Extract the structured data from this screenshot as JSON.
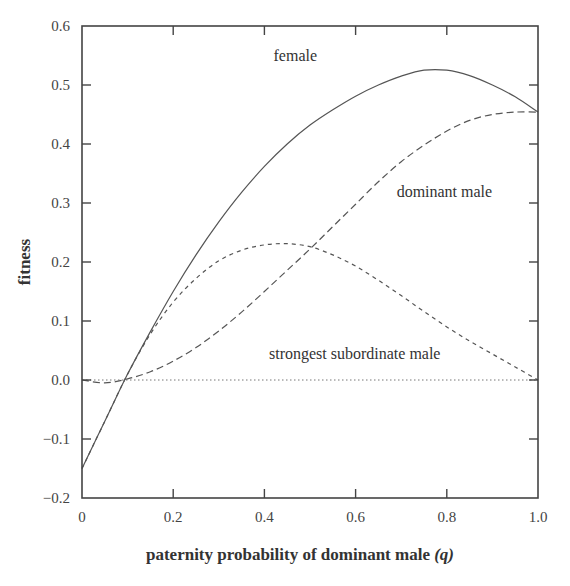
{
  "chart_data": {
    "type": "line",
    "title": "",
    "xlabel": "paternity probability of dominant male",
    "xlabel_symbol": "(q)",
    "ylabel": "fitness",
    "xlim": [
      0,
      1.0
    ],
    "ylim": [
      -0.2,
      0.6
    ],
    "x_ticks": [
      "0",
      "0.2",
      "0.4",
      "0.6",
      "0.8",
      "1.0"
    ],
    "x_tick_values": [
      0,
      0.2,
      0.4,
      0.6,
      0.8,
      1.0
    ],
    "y_ticks": [
      "−0.2",
      "−0.1",
      "0.0",
      "0.1",
      "0.2",
      "0.3",
      "0.4",
      "0.5",
      "0.6"
    ],
    "y_tick_values": [
      -0.2,
      -0.1,
      0.0,
      0.1,
      0.2,
      0.3,
      0.4,
      0.5,
      0.6
    ],
    "grid": false,
    "legend": "inline labels",
    "series": [
      {
        "name": "female",
        "style": "solid",
        "color": "#555555",
        "label_pos": [
          0.42,
          0.54
        ],
        "x": [
          0,
          0.05,
          0.1,
          0.15,
          0.2,
          0.25,
          0.3,
          0.35,
          0.4,
          0.45,
          0.5,
          0.55,
          0.6,
          0.65,
          0.7,
          0.75,
          0.8,
          0.85,
          0.9,
          0.95,
          1.0
        ],
        "y": [
          -0.15,
          -0.07,
          0.01,
          0.082,
          0.15,
          0.212,
          0.268,
          0.318,
          0.362,
          0.4,
          0.432,
          0.458,
          0.481,
          0.5,
          0.515,
          0.525,
          0.525,
          0.516,
          0.5,
          0.48,
          0.454
        ]
      },
      {
        "name": "dominant male",
        "style": "long-dash",
        "color": "#555555",
        "label_pos": [
          0.69,
          0.31
        ],
        "x": [
          0,
          0.05,
          0.1,
          0.15,
          0.2,
          0.25,
          0.3,
          0.35,
          0.4,
          0.45,
          0.5,
          0.55,
          0.6,
          0.65,
          0.7,
          0.75,
          0.8,
          0.85,
          0.9,
          0.95,
          1.0
        ],
        "y": [
          0.0,
          -0.005,
          0.002,
          0.014,
          0.032,
          0.055,
          0.083,
          0.115,
          0.15,
          0.186,
          0.222,
          0.26,
          0.298,
          0.336,
          0.37,
          0.398,
          0.422,
          0.44,
          0.45,
          0.454,
          0.454
        ]
      },
      {
        "name": "strongest subordinate male",
        "style": "short-dash",
        "color": "#555555",
        "label_pos": [
          0.41,
          0.035
        ],
        "x": [
          0,
          0.05,
          0.1,
          0.15,
          0.2,
          0.25,
          0.3,
          0.35,
          0.4,
          0.45,
          0.5,
          0.55,
          0.6,
          0.65,
          0.7,
          0.75,
          0.8,
          0.85,
          0.9,
          0.95,
          1.0
        ],
        "y": [
          -0.15,
          -0.07,
          0.01,
          0.078,
          0.132,
          0.172,
          0.202,
          0.22,
          0.229,
          0.231,
          0.226,
          0.212,
          0.193,
          0.169,
          0.143,
          0.116,
          0.09,
          0.066,
          0.044,
          0.022,
          0.0
        ]
      },
      {
        "name": "zero line",
        "style": "dotted",
        "color": "#777777",
        "x": [
          0,
          1.0
        ],
        "y": [
          0,
          0
        ]
      }
    ]
  }
}
